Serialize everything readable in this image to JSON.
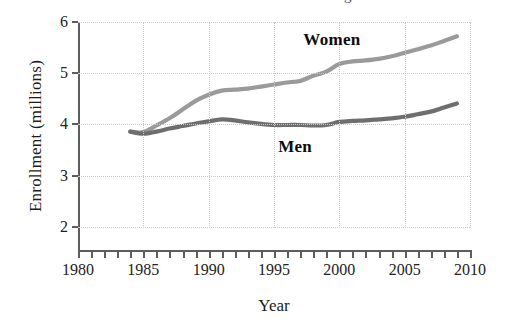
{
  "figure": {
    "title_remnant": "g",
    "background_color": "#ffffff"
  },
  "chart_data": {
    "type": "line",
    "title": "",
    "xlabel": "Year",
    "ylabel": "Enrollment (millions)",
    "xlim": [
      1980,
      2010
    ],
    "ylim": [
      1.55,
      6.0
    ],
    "grid": true,
    "legend_position": "inline-labels",
    "x_ticks_major": [
      1980,
      1985,
      1990,
      1995,
      2000,
      2005,
      2010
    ],
    "x_tick_labels": [
      "1980",
      "1985",
      "1990",
      "1995",
      "2000",
      "2005",
      "2010"
    ],
    "x_tick_minor_step": 1,
    "y_ticks": [
      2,
      3,
      4,
      5,
      6
    ],
    "y_tick_labels": [
      "2",
      "3",
      "4",
      "5",
      "6"
    ],
    "x": [
      1984,
      1985,
      1986,
      1987,
      1988,
      1989,
      1990,
      1991,
      1992,
      1993,
      1994,
      1995,
      1996,
      1997,
      1998,
      1999,
      2000,
      2001,
      2002,
      2003,
      2004,
      2005,
      2006,
      2007,
      2008,
      2009
    ],
    "series": [
      {
        "name": "Women",
        "color": "#9a9a9a",
        "label_x": 2000,
        "label_y": 5.62,
        "values": [
          3.86,
          3.85,
          3.98,
          4.12,
          4.29,
          4.46,
          4.58,
          4.66,
          4.68,
          4.7,
          4.74,
          4.78,
          4.82,
          4.85,
          4.95,
          5.03,
          5.18,
          5.23,
          5.25,
          5.28,
          5.33,
          5.4,
          5.47,
          5.54,
          5.63,
          5.72
        ]
      },
      {
        "name": "Men",
        "color": "#6e6e6e",
        "label_x": 1997,
        "label_y": 3.54,
        "values": [
          3.86,
          3.82,
          3.86,
          3.92,
          3.97,
          4.02,
          4.06,
          4.1,
          4.08,
          4.04,
          4.01,
          3.99,
          3.99,
          3.99,
          3.98,
          3.99,
          4.05,
          4.07,
          4.08,
          4.1,
          4.12,
          4.15,
          4.2,
          4.25,
          4.33,
          4.41
        ]
      }
    ]
  }
}
